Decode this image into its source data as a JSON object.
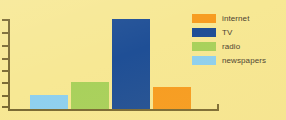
{
  "chart_data": {
    "type": "bar",
    "title": "",
    "subtitle": "",
    "xlabel": "",
    "ylabel": "",
    "grid": false,
    "legend_position": "top-right",
    "axis_color": "#7a6a34",
    "background_color": "#f7e894",
    "y_tick_count": 8,
    "ylim": [
      0,
      8
    ],
    "categories": [
      "newspapers",
      "radio",
      "TV",
      "internet"
    ],
    "values": [
      1.2,
      2.4,
      7.8,
      2.0
    ],
    "series": [
      {
        "name": "media usage",
        "values": [
          1.2,
          2.4,
          7.8,
          2.0
        ]
      }
    ],
    "bars": [
      {
        "category": "newspapers",
        "value": 1.2,
        "color": "#8ed0f0",
        "left_px": 30,
        "width_px": 38,
        "height_px": 14
      },
      {
        "category": "radio",
        "value": 2.4,
        "color": "#a8d15c",
        "left_px": 71,
        "width_px": 38,
        "height_px": 27
      },
      {
        "category": "TV",
        "value": 7.8,
        "color": "#1f4f96",
        "left_px": 112,
        "width_px": 38,
        "height_px": 90
      },
      {
        "category": "internet",
        "value": 2.0,
        "color": "#f79c20",
        "left_px": 153,
        "width_px": 38,
        "height_px": 22
      }
    ],
    "legend": [
      {
        "label": "internet",
        "color": "#f79c20"
      },
      {
        "label": "TV",
        "color": "#1f4f96"
      },
      {
        "label": "radio",
        "color": "#a8d15c"
      },
      {
        "label": "newspapers",
        "color": "#8ed0f0"
      }
    ],
    "y_ticks": [
      {
        "index": 0,
        "top_px": 19
      },
      {
        "index": 1,
        "top_px": 32
      },
      {
        "index": 2,
        "top_px": 45
      },
      {
        "index": 3,
        "top_px": 58
      },
      {
        "index": 4,
        "top_px": 70
      },
      {
        "index": 5,
        "top_px": 82
      },
      {
        "index": 6,
        "top_px": 95
      },
      {
        "index": 7,
        "top_px": 106
      }
    ]
  }
}
